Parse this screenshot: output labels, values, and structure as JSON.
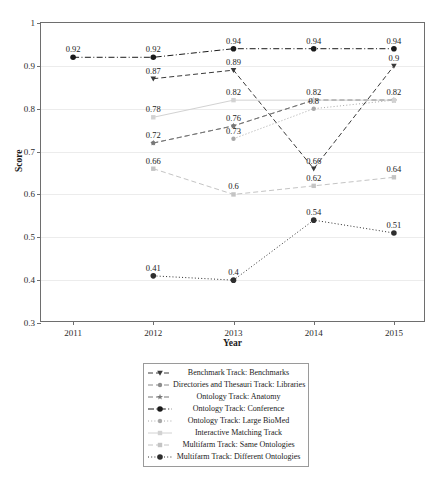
{
  "chart_data": {
    "type": "line",
    "title": "",
    "xlabel": "Year",
    "ylabel": "Score",
    "grid": true,
    "legend_position": "bottom",
    "categories": [
      "2011",
      "2012",
      "2013",
      "2014",
      "2015"
    ],
    "x": [
      2011,
      2012,
      2013,
      2014,
      2015
    ],
    "xlim": [
      2010.6,
      2015.4
    ],
    "ylim": [
      0.3,
      1
    ],
    "ytick_labels": [
      "0.3",
      "0.4",
      "0.5",
      "0.6",
      "0.7",
      "0.8",
      "0.9",
      "1"
    ],
    "ytick_values": [
      0.3,
      0.4,
      0.5,
      0.6,
      0.7,
      0.8,
      0.9,
      1
    ],
    "xtick_labels": [
      "2011",
      "2012",
      "2013",
      "2014",
      "2015"
    ],
    "series": [
      {
        "name": "Benchmark Track: Benchmarks",
        "marker": "triangle-down",
        "linestyle": "dashed",
        "color": "#3a3a3a",
        "x": [
          2012,
          2013,
          2014,
          2015
        ],
        "values": [
          0.87,
          0.89,
          0.66,
          0.9
        ],
        "labels": [
          "0.87",
          "0.89",
          "0.66",
          "0.9"
        ]
      },
      {
        "name": "Directories and Thesauri Track: Libraries",
        "marker": "circle",
        "linestyle": "dashed",
        "color": "#8c8c8c",
        "x": [
          2012,
          2013,
          2014,
          2015
        ],
        "values": [
          0.72,
          0.76,
          0.82,
          0.82
        ],
        "labels": [
          "0.72",
          "0.76",
          "",
          ""
        ]
      },
      {
        "name": "Ontology Track: Anatomy",
        "marker": "star",
        "linestyle": "dashed",
        "color": "#777777",
        "x": [
          2012,
          2013,
          2014,
          2015
        ],
        "values": [
          0.72,
          0.76,
          0.82,
          0.82
        ],
        "labels": [
          "",
          "",
          "",
          ""
        ]
      },
      {
        "name": "Ontology Track: Conference",
        "marker": "circle-filled",
        "linestyle": "dashdot",
        "color": "#1a1a1a",
        "x": [
          2011,
          2012,
          2013,
          2014,
          2015
        ],
        "values": [
          0.92,
          0.92,
          0.94,
          0.94,
          0.94
        ],
        "labels": [
          "0.92",
          "0.92",
          "0.94",
          "0.94",
          "0.94"
        ]
      },
      {
        "name": "Ontology Track: Large BioMed",
        "marker": "circle",
        "linestyle": "dotted",
        "color": "#a8a8a8",
        "x": [
          2013,
          2014,
          2015
        ],
        "values": [
          0.73,
          0.8,
          0.82
        ],
        "labels": [
          "0.73",
          "0.8",
          "0.82"
        ]
      },
      {
        "name": "Interactive Matching Track",
        "marker": "square",
        "linestyle": "solid",
        "color": "#d2d2d2",
        "x": [
          2012,
          2013,
          2014,
          2015
        ],
        "values": [
          0.78,
          0.82,
          0.82,
          0.82
        ],
        "labels": [
          "0.78",
          "0.82",
          "0.82",
          "0.82"
        ]
      },
      {
        "name": "Multifarm Track: Same Ontologies",
        "marker": "square",
        "linestyle": "dashed",
        "color": "#c4c4c4",
        "x": [
          2012,
          2013,
          2014,
          2015
        ],
        "values": [
          0.66,
          0.6,
          0.62,
          0.64
        ],
        "labels": [
          "0.66",
          "0.6",
          "0.62",
          "0.64"
        ]
      },
      {
        "name": "Multifarm Track: Different Ontologies",
        "marker": "circle-filled",
        "linestyle": "dotted",
        "color": "#2e2e2e",
        "x": [
          2012,
          2013,
          2014,
          2015
        ],
        "values": [
          0.41,
          0.4,
          0.54,
          0.51
        ],
        "labels": [
          "0.41",
          "0.4",
          "0.54",
          "0.51"
        ]
      }
    ],
    "annotations": [
      {
        "text": "0.92",
        "x": 2011,
        "y": 0.92
      },
      {
        "text": "0.92",
        "x": 2012,
        "y": 0.92
      },
      {
        "text": "0.94",
        "x": 2013,
        "y": 0.94
      },
      {
        "text": "0.94",
        "x": 2014,
        "y": 0.94
      },
      {
        "text": "0.94",
        "x": 2015,
        "y": 0.94
      },
      {
        "text": "0.87",
        "x": 2012,
        "y": 0.87
      },
      {
        "text": "0.89",
        "x": 2013,
        "y": 0.89
      },
      {
        "text": "0.66",
        "x": 2014,
        "y": 0.66
      },
      {
        "text": "0.9",
        "x": 2015,
        "y": 0.9
      },
      {
        "text": "0.78",
        "x": 2012,
        "y": 0.78
      },
      {
        "text": "0.82",
        "x": 2013,
        "y": 0.82
      },
      {
        "text": "0.82",
        "x": 2014,
        "y": 0.82
      },
      {
        "text": "0.82",
        "x": 2015,
        "y": 0.82
      },
      {
        "text": "0.72",
        "x": 2012,
        "y": 0.72
      },
      {
        "text": "0.76",
        "x": 2013,
        "y": 0.76
      },
      {
        "text": "0.73",
        "x": 2013,
        "y": 0.73
      },
      {
        "text": "0.8",
        "x": 2014,
        "y": 0.8
      },
      {
        "text": "0.66",
        "x": 2012,
        "y": 0.66
      },
      {
        "text": "0.6",
        "x": 2013,
        "y": 0.6
      },
      {
        "text": "0.62",
        "x": 2014,
        "y": 0.62
      },
      {
        "text": "0.64",
        "x": 2015,
        "y": 0.64
      },
      {
        "text": "0.41",
        "x": 2012,
        "y": 0.41
      },
      {
        "text": "0.4",
        "x": 2013,
        "y": 0.4
      },
      {
        "text": "0.54",
        "x": 2014,
        "y": 0.54
      },
      {
        "text": "0.51",
        "x": 2015,
        "y": 0.51
      }
    ]
  },
  "legend": {
    "entries": [
      "Benchmark Track: Benchmarks",
      "Directories and Thesauri Track: Libraries",
      "Ontology Track: Anatomy",
      "Ontology Track: Conference",
      "Ontology Track: Large BioMed",
      "Interactive Matching Track",
      "Multifarm Track: Same Ontologies",
      "Multifarm Track: Different Ontologies"
    ]
  }
}
